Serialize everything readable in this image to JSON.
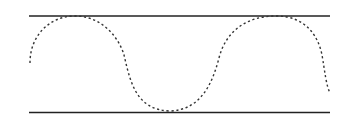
{
  "diagram": {
    "colors": {
      "background": "#ffffff",
      "boundary_line": "#222222",
      "wave": "#333333"
    },
    "upper_boundary": {
      "x1": 29,
      "x2": 330,
      "y": 16
    },
    "lower_boundary": {
      "x1": 29,
      "x2": 330,
      "y": 112
    },
    "wave": {
      "style": "dashed",
      "start": [
        30,
        63
      ],
      "peaks": [
        [
          75,
          16
        ],
        [
          276,
          16
        ]
      ],
      "troughs": [
        [
          170,
          111
        ]
      ],
      "end": [
        330,
        93
      ]
    }
  }
}
